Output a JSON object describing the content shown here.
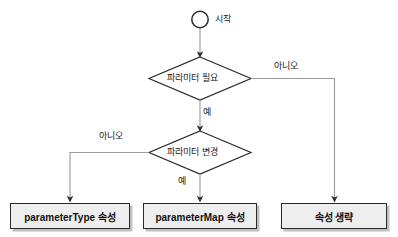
{
  "diagram": {
    "title": "",
    "colors": {
      "background": "#ffffff",
      "line": "#9a9a9a",
      "shape_stroke": "#2b2b2b",
      "box_fill": "#eeeeee",
      "text": "#111111"
    },
    "start": {
      "shape": "circle",
      "label": "시작"
    },
    "decisions": [
      {
        "id": "need-parameter",
        "label": "파라미터 필요",
        "yes_label": "예",
        "no_label": "아니오"
      },
      {
        "id": "change-parameter",
        "label": "파라미터 변경",
        "yes_label": "예",
        "no_label": "아니오"
      }
    ],
    "terminals": [
      {
        "id": "parameter-type",
        "label": "parameterType 속성"
      },
      {
        "id": "parameter-map",
        "label": "parameterMap 속성"
      },
      {
        "id": "omit-attribute",
        "label": "속성 생략"
      }
    ]
  }
}
